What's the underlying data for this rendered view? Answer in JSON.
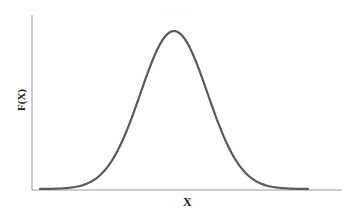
{
  "chart_data": {
    "type": "line",
    "title": "",
    "subtitle": "Normal (bell-shaped) distribution curve",
    "xlabel": "X",
    "ylabel": "F(X)",
    "x_ticks": [],
    "y_ticks": [],
    "grid": false,
    "legend": null,
    "series": [
      {
        "name": "F(X)",
        "x": [
          -4,
          -3.5,
          -3,
          -2.5,
          -2,
          -1.5,
          -1,
          -0.5,
          0,
          0.5,
          1,
          1.5,
          2,
          2.5,
          3,
          3.5,
          4
        ],
        "values": [
          0.0001,
          0.0009,
          0.0044,
          0.0175,
          0.054,
          0.1295,
          0.242,
          0.3521,
          0.3989,
          0.3521,
          0.242,
          0.1295,
          0.054,
          0.0175,
          0.0044,
          0.0009,
          0.0001
        ]
      }
    ],
    "xlim": [
      -4,
      4
    ],
    "ylim": [
      0,
      0.45
    ],
    "colors": {
      "curve": "#5a5a5a",
      "axes": "#9a9a9a",
      "labels": "#222222"
    }
  },
  "labels": {
    "x_axis": "X",
    "y_axis": "F(X)"
  }
}
